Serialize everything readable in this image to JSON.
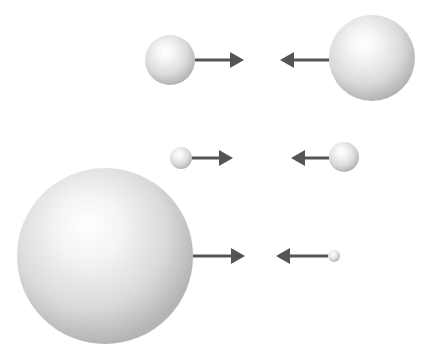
{
  "diagram": {
    "colors": {
      "background": "#ffffff",
      "arrow": "#555555",
      "sphere_highlight": "#ffffff",
      "sphere_mid": "#e2e2e2",
      "sphere_shadow": "#a8a8a8"
    },
    "pairs": [
      {
        "row": 1,
        "left_sphere": {
          "cx": 170,
          "cy": 60,
          "r": 25
        },
        "right_sphere": {
          "cx": 372,
          "cy": 58,
          "r": 43
        },
        "left_arrow": {
          "x1": 195,
          "x2": 244,
          "y": 60,
          "direction": "right"
        },
        "right_arrow": {
          "x1": 329,
          "x2": 280,
          "y": 60,
          "direction": "left"
        }
      },
      {
        "row": 2,
        "left_sphere": {
          "cx": 181,
          "cy": 158,
          "r": 11
        },
        "right_sphere": {
          "cx": 344,
          "cy": 157,
          "r": 15
        },
        "left_arrow": {
          "x1": 192,
          "x2": 233,
          "y": 158,
          "direction": "right"
        },
        "right_arrow": {
          "x1": 329,
          "x2": 291,
          "y": 158,
          "direction": "left"
        }
      },
      {
        "row": 3,
        "left_sphere": {
          "cx": 105,
          "cy": 256,
          "r": 88
        },
        "right_sphere": {
          "cx": 334,
          "cy": 256,
          "r": 6
        },
        "left_arrow": {
          "x1": 193,
          "x2": 245,
          "y": 256,
          "direction": "right"
        },
        "right_arrow": {
          "x1": 328,
          "x2": 276,
          "y": 256,
          "direction": "left"
        }
      }
    ]
  }
}
